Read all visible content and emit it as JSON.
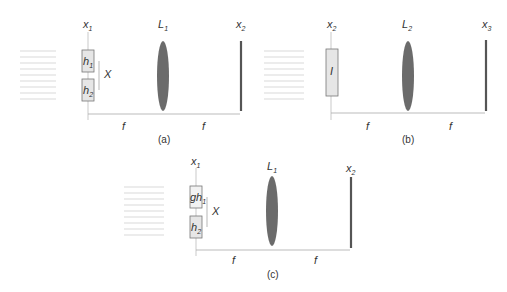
{
  "panels": [
    {
      "id": "a",
      "caption": "(a)",
      "planes": [
        {
          "name": "x",
          "sub": "1"
        },
        {
          "name": "L",
          "sub": "1"
        },
        {
          "name": "x",
          "sub": "2"
        }
      ],
      "boxes": [
        {
          "label": "h",
          "sub": "1"
        },
        {
          "label": "h",
          "sub": "2"
        }
      ],
      "separation_label": "X",
      "distances": [
        "f",
        "f"
      ]
    },
    {
      "id": "b",
      "caption": "(b)",
      "planes": [
        {
          "name": "x",
          "sub": "2"
        },
        {
          "name": "L",
          "sub": "2"
        },
        {
          "name": "x",
          "sub": "3"
        }
      ],
      "boxes": [
        {
          "label": "I",
          "sub": ""
        }
      ],
      "distances": [
        "f",
        "f"
      ]
    },
    {
      "id": "c",
      "caption": "(c)",
      "planes": [
        {
          "name": "x",
          "sub": "1"
        },
        {
          "name": "L",
          "sub": "1"
        },
        {
          "name": "x",
          "sub": "2"
        }
      ],
      "boxes": [
        {
          "label": "gh",
          "sub": "1"
        },
        {
          "label": "h",
          "sub": "2"
        }
      ],
      "separation_label": "X",
      "distances": [
        "f",
        "f"
      ]
    }
  ],
  "colors": {
    "lens": "#6b6b6b",
    "screen": "#555555",
    "box_fill": "#e6e6e6",
    "box_stroke": "#777777",
    "rays": "#bbbbbb",
    "axis": "#aaaaaa"
  }
}
